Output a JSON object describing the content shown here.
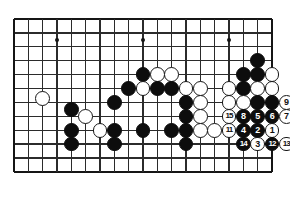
{
  "diagram": {
    "type": "go-board-problem",
    "board_size": 19,
    "visible_columns": 19,
    "visible_rows": 12,
    "grid": {
      "origin_x": 14,
      "origin_y": 19,
      "step_x": 14.33,
      "step_y": 13.9,
      "cols": 19,
      "rows": 12,
      "line_color": "#2b2b2b",
      "edge_color": "#151515",
      "background": "#ffffff"
    },
    "star_points": [
      {
        "col": 3,
        "row": 1.5
      },
      {
        "col": 9,
        "row": 1.5
      },
      {
        "col": 15,
        "row": 1.5
      },
      {
        "col": 9,
        "row": 7.7
      }
    ],
    "stone_colors": {
      "black": "#0d0d0d",
      "white": "#ffffff",
      "outline": "#161616",
      "black_label": "#ffffff",
      "white_label": "#111111"
    },
    "stone_radius": 7.4,
    "stones": [
      {
        "col": 2,
        "row": 5.7,
        "color": "white",
        "label": ""
      },
      {
        "col": 5,
        "row": 7.0,
        "color": "white",
        "label": ""
      },
      {
        "col": 6,
        "row": 8.0,
        "color": "white",
        "label": ""
      },
      {
        "col": 7,
        "row": 6.0,
        "color": "black",
        "label": ""
      },
      {
        "col": 7,
        "row": 8.0,
        "color": "black",
        "label": ""
      },
      {
        "col": 7,
        "row": 9.0,
        "color": "black",
        "label": ""
      },
      {
        "col": 9,
        "row": 4.0,
        "color": "black",
        "label": ""
      },
      {
        "col": 10,
        "row": 4.0,
        "color": "white",
        "label": ""
      },
      {
        "col": 11,
        "row": 4.0,
        "color": "white",
        "label": ""
      },
      {
        "col": 8,
        "row": 5.0,
        "color": "black",
        "label": ""
      },
      {
        "col": 9,
        "row": 5.0,
        "color": "white",
        "label": ""
      },
      {
        "col": 10,
        "row": 5.0,
        "color": "black",
        "label": ""
      },
      {
        "col": 11,
        "row": 5.0,
        "color": "black",
        "label": ""
      },
      {
        "col": 12,
        "row": 5.0,
        "color": "white",
        "label": ""
      },
      {
        "col": 13,
        "row": 5.0,
        "color": "white",
        "label": ""
      },
      {
        "col": 12,
        "row": 6.0,
        "color": "black",
        "label": ""
      },
      {
        "col": 13,
        "row": 6.0,
        "color": "white",
        "label": ""
      },
      {
        "col": 12,
        "row": 7.0,
        "color": "black",
        "label": ""
      },
      {
        "col": 13,
        "row": 7.0,
        "color": "white",
        "label": ""
      },
      {
        "col": 12,
        "row": 8.0,
        "color": "black",
        "label": ""
      },
      {
        "col": 13,
        "row": 8.0,
        "color": "white",
        "label": ""
      },
      {
        "col": 11,
        "row": 8.0,
        "color": "black",
        "label": ""
      },
      {
        "col": 12,
        "row": 9.0,
        "color": "black",
        "label": ""
      },
      {
        "col": 17,
        "row": 3.0,
        "color": "black",
        "label": ""
      },
      {
        "col": 16,
        "row": 4.0,
        "color": "black",
        "label": ""
      },
      {
        "col": 17,
        "row": 4.0,
        "color": "black",
        "label": ""
      },
      {
        "col": 18,
        "row": 4.0,
        "color": "white",
        "label": ""
      },
      {
        "col": 15,
        "row": 5.0,
        "color": "white",
        "label": ""
      },
      {
        "col": 16,
        "row": 5.0,
        "color": "black",
        "label": ""
      },
      {
        "col": 17,
        "row": 5.0,
        "color": "white",
        "label": ""
      },
      {
        "col": 18,
        "row": 5.0,
        "color": "white",
        "label": ""
      },
      {
        "col": 15,
        "row": 6.0,
        "color": "white",
        "label": ""
      },
      {
        "col": 16,
        "row": 6.0,
        "color": "white",
        "label": ""
      },
      {
        "col": 17,
        "row": 6.0,
        "color": "black",
        "label": ""
      },
      {
        "col": 18,
        "row": 6.0,
        "color": "black",
        "label": ""
      },
      {
        "col": 19,
        "row": 6.0,
        "color": "white",
        "label": "9"
      },
      {
        "col": 15,
        "row": 7.0,
        "color": "white",
        "label": "15"
      },
      {
        "col": 16,
        "row": 7.0,
        "color": "black",
        "label": "8"
      },
      {
        "col": 17,
        "row": 7.0,
        "color": "black",
        "label": "5"
      },
      {
        "col": 18,
        "row": 7.0,
        "color": "black",
        "label": "6"
      },
      {
        "col": 19,
        "row": 7.0,
        "color": "white",
        "label": "7"
      },
      {
        "col": 15,
        "row": 8.0,
        "color": "white",
        "label": "11"
      },
      {
        "col": 16,
        "row": 8.0,
        "color": "black",
        "label": "4"
      },
      {
        "col": 17,
        "row": 8.0,
        "color": "black",
        "label": "2"
      },
      {
        "col": 18,
        "row": 8.0,
        "color": "white",
        "label": "1"
      },
      {
        "col": 16,
        "row": 9.0,
        "color": "black",
        "label": "14"
      },
      {
        "col": 17,
        "row": 9.0,
        "color": "white",
        "label": "3"
      },
      {
        "col": 18,
        "row": 9.0,
        "color": "black",
        "label": "12"
      },
      {
        "col": 19,
        "row": 9.0,
        "color": "white",
        "label": "13"
      },
      {
        "col": 14,
        "row": 8.0,
        "color": "white",
        "label": ""
      },
      {
        "col": 9,
        "row": 8.0,
        "color": "black",
        "label": ""
      },
      {
        "col": 4,
        "row": 8.0,
        "color": "black",
        "label": ""
      },
      {
        "col": 4,
        "row": 9.0,
        "color": "black",
        "label": ""
      },
      {
        "col": 4,
        "row": 6.5,
        "color": "black",
        "label": ""
      }
    ],
    "move_sequence": [
      {
        "move": 1,
        "color": "white"
      },
      {
        "move": 2,
        "color": "black"
      },
      {
        "move": 3,
        "color": "white"
      },
      {
        "move": 4,
        "color": "black"
      },
      {
        "move": 5,
        "color": "black"
      },
      {
        "move": 6,
        "color": "black"
      },
      {
        "move": 7,
        "color": "white"
      },
      {
        "move": 8,
        "color": "black"
      },
      {
        "move": 9,
        "color": "white"
      },
      {
        "move": 11,
        "color": "white"
      },
      {
        "move": 12,
        "color": "black"
      },
      {
        "move": 13,
        "color": "white"
      },
      {
        "move": 14,
        "color": "black"
      },
      {
        "move": 15,
        "color": "white"
      }
    ]
  }
}
